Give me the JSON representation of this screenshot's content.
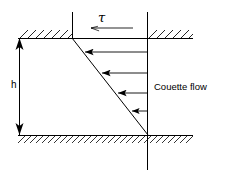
{
  "figure": {
    "name": "couette-flow-diagram",
    "caption_text": "Couette flow",
    "gap_label": "h",
    "shear_stress_label": "τ",
    "colors": {
      "line": "#000000",
      "hatch": "#000000",
      "profile": "#000000",
      "arrow": "#000000",
      "background": "#ffffff"
    },
    "geometry": {
      "top_wall_y": 38,
      "bottom_wall_y": 135,
      "wall_x_start": 18,
      "wall_x_end": 193,
      "left_vertical_x": 72,
      "right_vertical_x": 148,
      "gap_height_px": 97
    },
    "profile": {
      "type": "linear-velocity-profile",
      "top_point": [
        72,
        38
      ],
      "bottom_point": [
        148,
        135
      ],
      "description": "linear velocity profile between moving top plate and stationary bottom plate"
    },
    "velocity_arrows": [
      {
        "y": 52,
        "tail_x": 148,
        "head_x": 83,
        "length": 65
      },
      {
        "y": 73,
        "tail_x": 148,
        "head_x": 100,
        "length": 48
      },
      {
        "y": 93,
        "tail_x": 148,
        "head_x": 116,
        "length": 32
      },
      {
        "y": 111,
        "tail_x": 148,
        "head_x": 130,
        "length": 18
      }
    ],
    "shear_arrow": {
      "y": 28,
      "tail_x": 133,
      "head_x": 90,
      "direction": "left"
    },
    "gap_arrow": {
      "x": 19,
      "top_y": 38,
      "bottom_y": 135,
      "direction": "double"
    }
  }
}
